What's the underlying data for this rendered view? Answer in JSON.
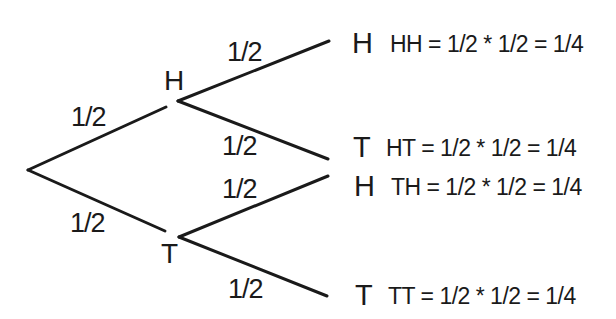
{
  "diagram": {
    "type": "probability-tree",
    "colors": {
      "line": "#1a1a1a",
      "text": "#1a1a1a",
      "background": "#ffffff"
    },
    "first_level": {
      "branches": [
        {
          "probability": "1/2",
          "node": "H"
        },
        {
          "probability": "1/2",
          "node": "T"
        }
      ]
    },
    "second_level": {
      "branches": [
        {
          "parent": "H",
          "probability": "1/2",
          "outcome": "H",
          "equation": "HH = 1/2 * 1/2 = 1/4"
        },
        {
          "parent": "H",
          "probability": "1/2",
          "outcome": "T",
          "equation": "HT = 1/2 * 1/2 = 1/4"
        },
        {
          "parent": "T",
          "probability": "1/2",
          "outcome": "H",
          "equation": "TH = 1/2 * 1/2 = 1/4"
        },
        {
          "parent": "T",
          "probability": "1/2",
          "outcome": "T",
          "equation": "TT = 1/2 * 1/2 = 1/4"
        }
      ]
    }
  }
}
